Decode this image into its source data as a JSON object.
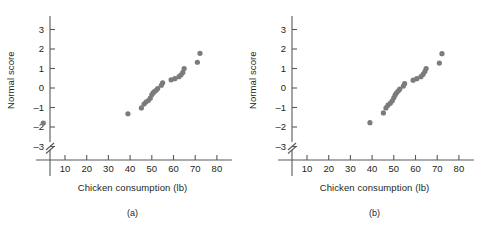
{
  "figure": {
    "panels": [
      {
        "caption": "(a)",
        "name": "panel-a",
        "chart_data": {
          "type": "scatter",
          "title": "",
          "xlabel": "Chicken consumption (lb)",
          "ylabel": "Normal score",
          "xlim": [
            0,
            85
          ],
          "ylim": [
            -3.6,
            3.6
          ],
          "xticks": [
            10,
            20,
            30,
            40,
            50,
            60,
            70,
            80
          ],
          "yticks": [
            3,
            2,
            1,
            0,
            -1,
            -2,
            -3
          ],
          "grid": false,
          "legend": null,
          "axis_break": "y-axis below -3",
          "marker_color": "#7b7b7b",
          "x": [
            0,
            39.0,
            45.2,
            46.4,
            47.3,
            48.4,
            49.3,
            50.0,
            50.6,
            51.2,
            52.0,
            52.7,
            54.4,
            55.0,
            58.9,
            60.6,
            62.5,
            63.5,
            64.3,
            64.9,
            71.0,
            72.2
          ],
          "y": [
            -1.8,
            -1.32,
            -1.02,
            -0.82,
            -0.72,
            -0.64,
            -0.52,
            -0.35,
            -0.25,
            -0.18,
            -0.12,
            -0.03,
            0.14,
            0.27,
            0.42,
            0.48,
            0.58,
            0.68,
            0.8,
            1.0,
            1.32,
            1.78
          ]
        }
      },
      {
        "caption": "(b)",
        "name": "panel-b",
        "chart_data": {
          "type": "scatter",
          "title": "",
          "xlabel": "Chicken consumption (lb)",
          "ylabel": "Normal score",
          "xlim": [
            0,
            85
          ],
          "ylim": [
            -3.6,
            3.6
          ],
          "xticks": [
            10,
            20,
            30,
            40,
            50,
            60,
            70,
            80
          ],
          "yticks": [
            3,
            2,
            1,
            0,
            -1,
            -2,
            -3
          ],
          "grid": false,
          "legend": null,
          "axis_break": "y-axis below -3",
          "marker_color": "#7b7b7b",
          "x": [
            39.0,
            45.2,
            46.4,
            47.3,
            48.4,
            49.3,
            50.0,
            50.6,
            51.2,
            52.0,
            52.7,
            54.4,
            55.0,
            58.9,
            60.6,
            62.5,
            63.5,
            64.3,
            64.9,
            71.0,
            72.2
          ],
          "y": [
            -1.78,
            -1.28,
            -1.02,
            -0.88,
            -0.78,
            -0.66,
            -0.5,
            -0.36,
            -0.26,
            -0.16,
            -0.06,
            0.1,
            0.22,
            0.4,
            0.48,
            0.58,
            0.7,
            0.84,
            1.0,
            1.28,
            1.76
          ]
        }
      }
    ]
  }
}
